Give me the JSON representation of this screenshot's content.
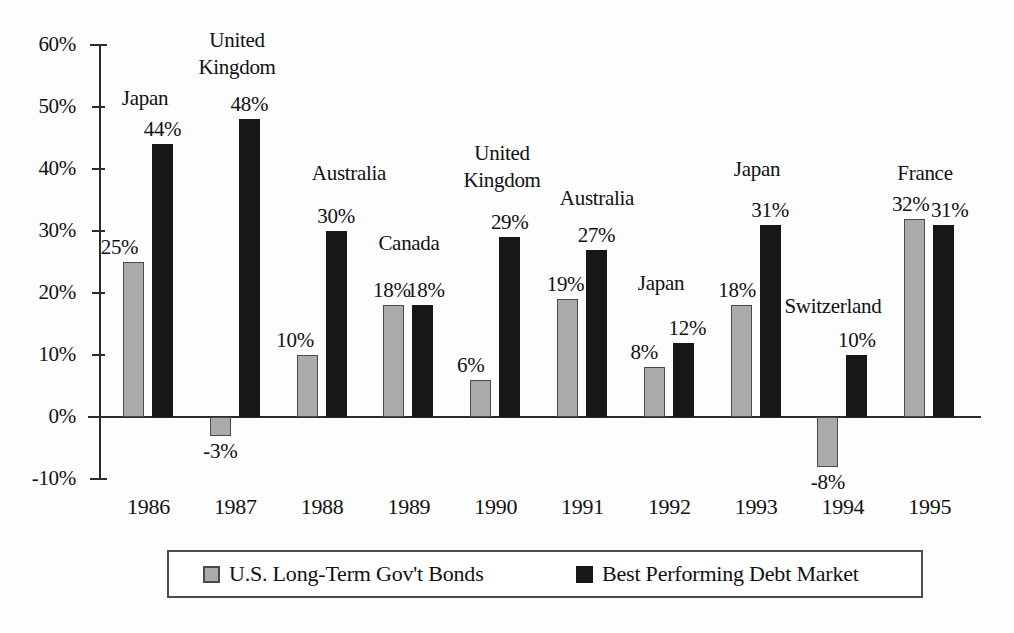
{
  "chart_data": {
    "type": "bar",
    "title": "",
    "xlabel": "",
    "ylabel": "",
    "ylim": [
      -10,
      60
    ],
    "ytick_labels": [
      "60%",
      "50%",
      "40%",
      "30%",
      "20%",
      "10%",
      "0%",
      "-10%"
    ],
    "ytick_values": [
      60,
      50,
      40,
      30,
      20,
      10,
      0,
      -10
    ],
    "grid": false,
    "legend_position": "bottom",
    "categories": [
      "1986",
      "1987",
      "1988",
      "1989",
      "1990",
      "1991",
      "1992",
      "1993",
      "1994",
      "1995"
    ],
    "series": [
      {
        "name": "U.S. Long-Term Gov't Bonds",
        "color": "#ababab",
        "values": [
          25,
          -3,
          10,
          18,
          6,
          19,
          8,
          18,
          -8,
          32
        ],
        "labels": [
          "25%",
          "-3%",
          "10%",
          "18%",
          "6%",
          "19%",
          "8%",
          "18%",
          "-8%",
          "32%"
        ]
      },
      {
        "name": "Best Performing Debt Market",
        "color": "#17171a",
        "values": [
          44,
          48,
          30,
          18,
          29,
          27,
          12,
          31,
          10,
          31
        ],
        "labels": [
          "44%",
          "48%",
          "30%",
          "18%",
          "29%",
          "27%",
          "12%",
          "31%",
          "10%",
          "31%"
        ]
      }
    ],
    "annotations": [
      {
        "category": "1986",
        "country": "Japan"
      },
      {
        "category": "1987",
        "country": "United Kingdom"
      },
      {
        "category": "1988",
        "country": "Australia"
      },
      {
        "category": "1989",
        "country": "Canada"
      },
      {
        "category": "1990",
        "country": "United Kingdom"
      },
      {
        "category": "1991",
        "country": "Australia"
      },
      {
        "category": "1992",
        "country": "Japan"
      },
      {
        "category": "1993",
        "country": "Japan"
      },
      {
        "category": "1994",
        "country": "Switzerland"
      },
      {
        "category": "1995",
        "country": "France"
      }
    ]
  },
  "axis": {
    "ticks": [
      {
        "label": "60%"
      },
      {
        "label": "50%"
      },
      {
        "label": "40%"
      },
      {
        "label": "30%"
      },
      {
        "label": "20%"
      },
      {
        "label": "10%"
      },
      {
        "label": "0%"
      },
      {
        "label": "-10%"
      }
    ]
  },
  "xaxis": {
    "years": [
      {
        "label": "1986"
      },
      {
        "label": "1987"
      },
      {
        "label": "1988"
      },
      {
        "label": "1989"
      },
      {
        "label": "1990"
      },
      {
        "label": "1991"
      },
      {
        "label": "1992"
      },
      {
        "label": "1993"
      },
      {
        "label": "1994"
      },
      {
        "label": "1995"
      }
    ]
  },
  "country_labels": [
    {
      "text": "Japan"
    },
    {
      "text": "United"
    },
    {
      "text": "Kingdom"
    },
    {
      "text": "Australia"
    },
    {
      "text": "Canada"
    },
    {
      "text": "United"
    },
    {
      "text": "Kingdom"
    },
    {
      "text": "Australia"
    },
    {
      "text": "Japan"
    },
    {
      "text": "Japan"
    },
    {
      "text": "Switzerland"
    },
    {
      "text": "France"
    }
  ],
  "legend": {
    "entries": [
      {
        "label": "U.S. Long-Term Gov't Bonds",
        "swatch": "gray"
      },
      {
        "label": "Best Performing Debt Market",
        "swatch": "black"
      }
    ]
  }
}
